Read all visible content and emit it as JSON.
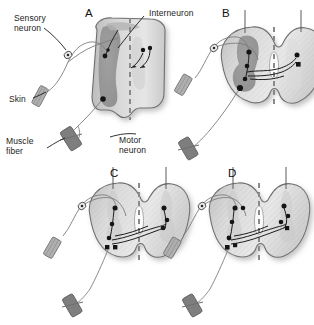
{
  "figure": {
    "background_color": "#ffffff",
    "ink_color": "#1b1b1b",
    "cord_fill": "#d4d4d4",
    "gray_matter_fill": "#9a9a9a",
    "neuron_dot_color": "#111111"
  },
  "labels": {
    "sensory_neuron": "Sensory\nneuron",
    "skin": "Skin",
    "muscle_fiber": "Muscle\nfiber",
    "interneuron": "Interneuron",
    "motor_neuron": "Motor\nneuron"
  },
  "panels": [
    {
      "id": "A",
      "letter": "A",
      "view": "oblique half cord",
      "name": "panel-a"
    },
    {
      "id": "B",
      "letter": "B",
      "view": "transverse cord with shaded left gray matter",
      "name": "panel-b"
    },
    {
      "id": "C",
      "letter": "C",
      "view": "transverse cord, bilateral pathways",
      "name": "panel-c"
    },
    {
      "id": "D",
      "letter": "D",
      "view": "transverse cord, hatched bilateral pathways",
      "name": "panel-d"
    }
  ],
  "structures": [
    {
      "name": "sensory-neuron-cell-body",
      "shape": "small open oval with central dot"
    },
    {
      "name": "skin-receptor",
      "shape": "hatched angled bar"
    },
    {
      "name": "muscle-fiber",
      "shape": "dark angled bar with cross-piece"
    },
    {
      "name": "midline",
      "shape": "vertical dashed line"
    },
    {
      "name": "central-canal",
      "shape": "small teardrop outline at cord center"
    },
    {
      "name": "interneuron-soma",
      "shape": "filled square/dot"
    },
    {
      "name": "motor-neuron-soma",
      "shape": "filled dot in ventral horn"
    }
  ]
}
